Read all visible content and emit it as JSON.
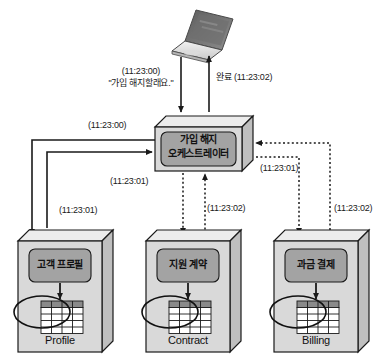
{
  "diagram": {
    "actor": {
      "name": "laptop",
      "icon": "laptop-icon"
    },
    "orchestrator": {
      "line1": "가입 해지",
      "line2": "오케스트레이터"
    },
    "edges": {
      "request_time": "(11:23:00)",
      "request_quote": "\"가입 해지할래요.\"",
      "complete": "완료 (11:23:02)",
      "orch_in_left": "(11:23:00)",
      "profile_call": "(11:23:01)",
      "contract_call": "(11:23:01)",
      "contract_return": "(11:23:02)",
      "billing_call": "(11:23:01)",
      "billing_return": "(11:23:02)",
      "orch_return_right": "(11:23:01)"
    },
    "services": [
      {
        "id": "profile",
        "service_label": "고객 프로필",
        "db_label": "Profile"
      },
      {
        "id": "contract",
        "service_label": "지원 계약",
        "db_label": "Contract"
      },
      {
        "id": "billing",
        "service_label": "과금 결제",
        "db_label": "Billing"
      }
    ],
    "colors": {
      "stroke": "#1a1a1a",
      "box_face": "#d9d9d9",
      "box_top": "#ececec",
      "box_side": "#bfbfbf",
      "inner_fill": "#a3a3a3",
      "table_header": "#8a8a8a",
      "table_cell": "#ffffff",
      "background": "#ffffff"
    }
  }
}
